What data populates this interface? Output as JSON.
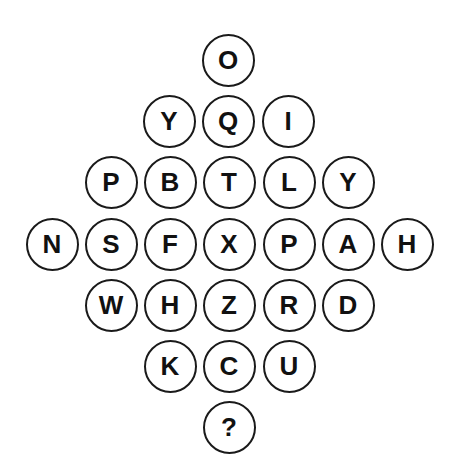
{
  "puzzle": {
    "rows": [
      {
        "y": 60,
        "cells": [
          {
            "letter": "O",
            "x": 228
          }
        ]
      },
      {
        "y": 121,
        "cells": [
          {
            "letter": "Y",
            "x": 169
          },
          {
            "letter": "Q",
            "x": 228
          },
          {
            "letter": "I",
            "x": 288
          }
        ]
      },
      {
        "y": 182,
        "cells": [
          {
            "letter": "P",
            "x": 111
          },
          {
            "letter": "B",
            "x": 170
          },
          {
            "letter": "T",
            "x": 229
          },
          {
            "letter": "L",
            "x": 289
          },
          {
            "letter": "Y",
            "x": 348
          }
        ]
      },
      {
        "y": 244,
        "cells": [
          {
            "letter": "N",
            "x": 52
          },
          {
            "letter": "S",
            "x": 111
          },
          {
            "letter": "F",
            "x": 170
          },
          {
            "letter": "X",
            "x": 229
          },
          {
            "letter": "P",
            "x": 289
          },
          {
            "letter": "A",
            "x": 348
          },
          {
            "letter": "H",
            "x": 407
          }
        ]
      },
      {
        "y": 305,
        "cells": [
          {
            "letter": "W",
            "x": 111
          },
          {
            "letter": "H",
            "x": 170
          },
          {
            "letter": "Z",
            "x": 229
          },
          {
            "letter": "R",
            "x": 289
          },
          {
            "letter": "D",
            "x": 348
          }
        ]
      },
      {
        "y": 366,
        "cells": [
          {
            "letter": "K",
            "x": 170
          },
          {
            "letter": "C",
            "x": 229
          },
          {
            "letter": "U",
            "x": 289
          }
        ]
      },
      {
        "y": 427,
        "cells": [
          {
            "letter": "?",
            "x": 229
          }
        ]
      }
    ],
    "colors": {
      "stroke": "#1a1a1a",
      "text": "#111111",
      "background": "#ffffff"
    }
  }
}
